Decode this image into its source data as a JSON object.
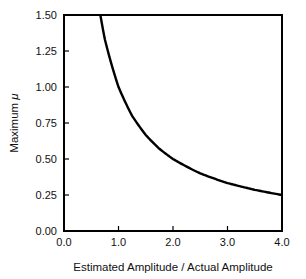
{
  "chart_data": {
    "type": "line",
    "title": "",
    "xlabel": "Estimated Amplitude / Actual Amplitude",
    "ylabel": "Maximum μ",
    "ylabel_prefix": "Maximum ",
    "ylabel_symbol": "μ",
    "xlim": [
      0.0,
      4.0
    ],
    "ylim": [
      0.0,
      1.5
    ],
    "x_ticks": [
      "0.0",
      "1.0",
      "2.0",
      "3.0",
      "4.0"
    ],
    "y_ticks": [
      "0.00",
      "0.25",
      "0.50",
      "0.75",
      "1.00",
      "1.25",
      "1.50"
    ],
    "grid": false,
    "legend": null,
    "series": [
      {
        "name": "Maximum mu",
        "x": [
          0.667,
          0.75,
          1.0,
          1.25,
          1.5,
          1.75,
          2.0,
          2.5,
          3.0,
          3.5,
          4.0
        ],
        "values": [
          1.5,
          1.33,
          1.0,
          0.8,
          0.667,
          0.571,
          0.5,
          0.4,
          0.333,
          0.286,
          0.25
        ],
        "color": "#000000"
      }
    ]
  }
}
